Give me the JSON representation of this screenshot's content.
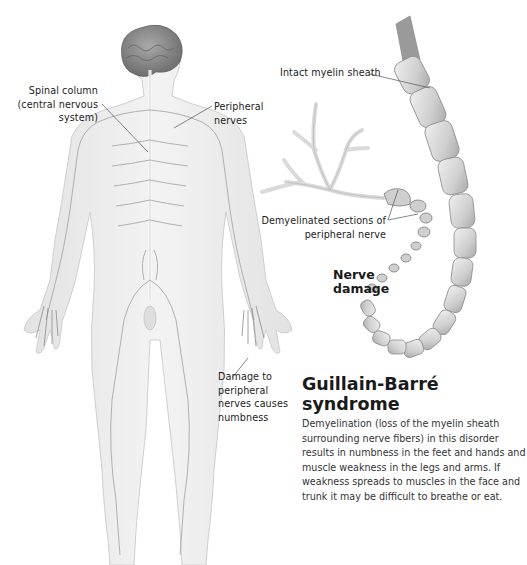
{
  "diagram": {
    "title": "Guillain-Barré syndrome",
    "description": "Demyelination (loss of the myelin sheath surrounding nerve fibers) in this disorder results in numbness in the feet and hands and muscle weakness in the legs and arms. If weakness spreads to muscles in the face and trunk it may be difficult to breathe or eat.",
    "labels": {
      "spinal_column_line1": "Spinal column",
      "spinal_column_line2": "(central nervous",
      "spinal_column_line3": "system)",
      "peripheral_nerves_line1": "Peripheral",
      "peripheral_nerves_line2": "nerves",
      "intact_myelin": "Intact myelin sheath",
      "demyelinated_line1": "Demyelinated sections of",
      "demyelinated_line2": "peripheral nerve",
      "nerve_damage_line1": "Nerve",
      "nerve_damage_line2": "damage",
      "damage_line1": "Damage to",
      "damage_line2": "peripheral",
      "damage_line3": "nerves causes",
      "damage_line4": "numbness"
    },
    "colors": {
      "background": "#ffffff",
      "body_fill": "#ebebeb",
      "body_stroke": "#c8c8c8",
      "nerve_line": "#9a9a9a",
      "brain": "#8a8a8a",
      "myelin_fill": "#d6d6d6",
      "myelin_stroke": "#8c8c8c",
      "leader_line": "#555555"
    }
  }
}
